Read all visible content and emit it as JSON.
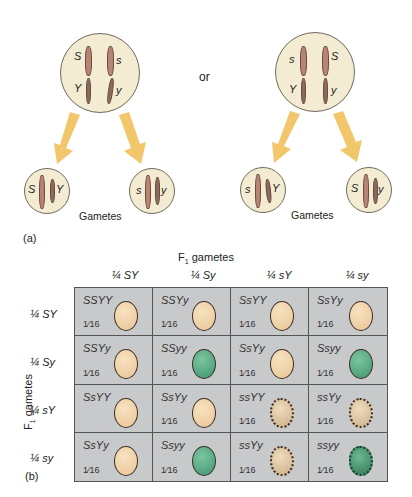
{
  "panel_a": {
    "label": "(a)",
    "or_label": "or",
    "left_cell": {
      "top_row": {
        "left": "S",
        "right": "s"
      },
      "bottom_row": {
        "left": "Y",
        "right": "y"
      }
    },
    "right_cell": {
      "top_row": {
        "left": "s",
        "right": "S"
      },
      "bottom_row": {
        "left": "Y",
        "right": "y"
      }
    },
    "gametes": [
      {
        "alleles": [
          "S",
          "Y"
        ]
      },
      {
        "alleles": [
          "s",
          "y"
        ]
      },
      {
        "alleles": [
          "s",
          "Y"
        ]
      },
      {
        "alleles": [
          "S",
          "y"
        ]
      }
    ],
    "gametes_label_left": "Gametes",
    "gametes_label_right": "Gametes",
    "arrow_color": "#f2c66b"
  },
  "panel_b": {
    "label": "(b)",
    "top_title": "F1 gametes",
    "top_title_main": "F",
    "top_title_sub": "1",
    "top_title_rest": " gametes",
    "side_title_main": "F",
    "side_title_sub": "1",
    "side_title_rest": " gametes",
    "columns": [
      "¼ SY",
      "¼ Sy",
      "¼ sY",
      "¼ sy"
    ],
    "rows": [
      "¼ SY",
      "¼ Sy",
      "¼ sY",
      "¼ sy"
    ],
    "cells": [
      [
        {
          "genotype": "SSYY",
          "fraction": "1⁄16",
          "pea": "round-yellow"
        },
        {
          "genotype": "SSYy",
          "fraction": "1⁄16",
          "pea": "round-yellow"
        },
        {
          "genotype": "SsYY",
          "fraction": "1⁄16",
          "pea": "round-yellow"
        },
        {
          "genotype": "SsYy",
          "fraction": "1⁄16",
          "pea": "round-yellow"
        }
      ],
      [
        {
          "genotype": "SSYy",
          "fraction": "1⁄16",
          "pea": "round-yellow"
        },
        {
          "genotype": "SSyy",
          "fraction": "1⁄16",
          "pea": "round-green"
        },
        {
          "genotype": "SsYy",
          "fraction": "1⁄16",
          "pea": "round-yellow"
        },
        {
          "genotype": "Ssyy",
          "fraction": "1⁄16",
          "pea": "round-green"
        }
      ],
      [
        {
          "genotype": "SsYY",
          "fraction": "",
          "pea": "round-yellow"
        },
        {
          "genotype": "SsYy",
          "fraction": "1⁄16",
          "pea": "round-yellow"
        },
        {
          "genotype": "ssYY",
          "fraction": "1⁄16",
          "pea": "wrinkled-yellow"
        },
        {
          "genotype": "ssYy",
          "fraction": "1⁄16",
          "pea": "wrinkled-yellow"
        }
      ],
      [
        {
          "genotype": "SsYy",
          "fraction": "1⁄16",
          "pea": "round-yellow"
        },
        {
          "genotype": "Ssyy",
          "fraction": "1⁄16",
          "pea": "round-green"
        },
        {
          "genotype": "ssYy",
          "fraction": "1⁄16",
          "pea": "wrinkled-yellow"
        },
        {
          "genotype": "ssyy",
          "fraction": "1⁄16",
          "pea": "wrinkled-green"
        }
      ]
    ],
    "colors": {
      "grid_bg": "#c8c9cb",
      "pea_yellow": "#f0d2a8",
      "pea_green": "#4fa77e",
      "cell_nucleus": "#f3ecd2"
    }
  }
}
